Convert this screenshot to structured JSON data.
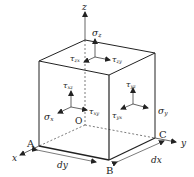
{
  "diagram": {
    "axes": {
      "x": "x",
      "y": "y",
      "z": "z"
    },
    "origin": "O",
    "corners": {
      "A": "A",
      "B": "B",
      "C": "C"
    },
    "dimensions": {
      "dy": "dy",
      "dx": "dx"
    },
    "stresses": {
      "sigma_z": {
        "sym": "σ",
        "sub": "z"
      },
      "tau_zx": {
        "sym": "τ",
        "sub": "zx"
      },
      "tau_zy": {
        "sym": "τ",
        "sub": "zy"
      },
      "tau_xz": {
        "sym": "τ",
        "sub": "xz"
      },
      "sigma_x": {
        "sym": "σ",
        "sub": "x"
      },
      "tau_xy": {
        "sym": "τ",
        "sub": "xy"
      },
      "tau_yz": {
        "sym": "τ",
        "sub": "yz"
      },
      "tau_yx": {
        "sym": "τ",
        "sub": "yx"
      },
      "sigma_y": {
        "sym": "σ",
        "sub": "y"
      }
    },
    "colors": {
      "line": "#222222",
      "background": "#ffffff"
    }
  }
}
